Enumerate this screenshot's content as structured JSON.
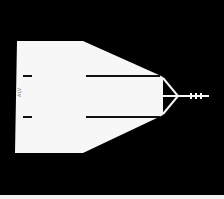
{
  "figure": {
    "background_color": "#000000",
    "metal_color": "#f7f7f7",
    "slot_color": "#111111",
    "label": "ALV"
  }
}
